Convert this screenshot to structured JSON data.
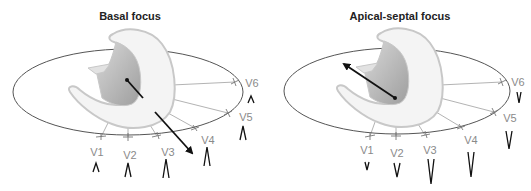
{
  "panels": [
    {
      "title": "Basal focus",
      "vector_direction": "toward V4 (anterior-inferior, away from base)",
      "complex_polarity": "positive",
      "leads": [
        {
          "label": "V1",
          "wave": "upright",
          "height": "small"
        },
        {
          "label": "V2",
          "wave": "upright",
          "height": "medium"
        },
        {
          "label": "V3",
          "wave": "upright",
          "height": "large"
        },
        {
          "label": "V4",
          "wave": "upright",
          "height": "large"
        },
        {
          "label": "V5",
          "wave": "upright",
          "height": "medium"
        },
        {
          "label": "V6",
          "wave": "upright",
          "height": "small"
        }
      ]
    },
    {
      "title": "Apical-septal focus",
      "vector_direction": "toward upper left (posterior-superior)",
      "complex_polarity": "negative",
      "leads": [
        {
          "label": "V1",
          "wave": "inverted",
          "height": "small"
        },
        {
          "label": "V2",
          "wave": "inverted",
          "height": "medium"
        },
        {
          "label": "V3",
          "wave": "inverted",
          "height": "large"
        },
        {
          "label": "V4",
          "wave": "inverted",
          "height": "large"
        },
        {
          "label": "V5",
          "wave": "inverted",
          "height": "medium"
        },
        {
          "label": "V6",
          "wave": "inverted",
          "height": "small"
        }
      ]
    }
  ],
  "colors": {
    "ellipse_stroke": "#555555",
    "heart_fill": "#f4f4f4",
    "heart_stroke": "#c8c8c8",
    "cavity_fill": "#b9b9b9",
    "arrow": "#111111",
    "lead_text": "#8a8a8a",
    "lead_line": "#a0a0a0"
  }
}
